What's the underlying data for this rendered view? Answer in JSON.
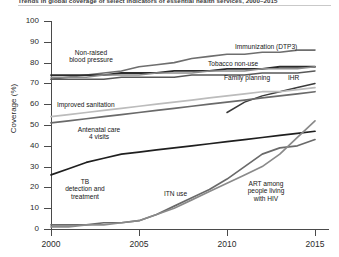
{
  "figure": {
    "title": "Trends in global coverage of select indicators of essential health services, 2000–2015",
    "y_axis_title": "Coverage (%)",
    "y_ticks": [
      "0",
      "10",
      "20",
      "30",
      "40",
      "50",
      "60",
      "70",
      "80",
      "90",
      "100"
    ],
    "x_ticks": [
      "2000",
      "2005",
      "2010",
      "2015"
    ]
  },
  "annotations": {
    "non_raised_bp": "Non-raised\nblood pressure",
    "non_raised_bp_l1": "Non-raised",
    "non_raised_bp_l2": "blood pressure",
    "immunization": "Immunization (DTP3)",
    "tobacco": "Tobacco non-use",
    "family_planning": "Family planning",
    "ihr": "IHR",
    "sanitation": "Improved sanitation",
    "anc_l1": "Antenatal care",
    "anc_l2": "4 visits",
    "tb_l1": "TB",
    "tb_l2": "detection and",
    "tb_l3": "treatment",
    "itn": "ITN use",
    "art_l1": "ART among",
    "art_l2": "people living",
    "art_l3": "with HIV"
  },
  "chart_data": {
    "type": "line",
    "title": "Trends in global coverage of select indicators of essential health services, 2000–2015",
    "xlabel": "",
    "ylabel": "Coverage (%)",
    "xlim": [
      2000,
      2015
    ],
    "ylim": [
      0,
      100
    ],
    "grid": false,
    "legend": "inline-labels",
    "x": [
      2000,
      2001,
      2002,
      2003,
      2004,
      2005,
      2006,
      2007,
      2008,
      2009,
      2010,
      2011,
      2012,
      2013,
      2014,
      2015
    ],
    "series": [
      {
        "name": "Immunization (DTP3)",
        "color": "#6e6e6e",
        "width": 1.6,
        "values": [
          72,
          73,
          74,
          75,
          76,
          78,
          79,
          80,
          82,
          83,
          84,
          84,
          85,
          85,
          86,
          86
        ]
      },
      {
        "name": "Non-raised blood pressure",
        "color": "#2b2b2b",
        "width": 1.8,
        "values": [
          74,
          74,
          74,
          74,
          75,
          75,
          75,
          76,
          76,
          76,
          77,
          77,
          77,
          78,
          78,
          78
        ]
      },
      {
        "name": "Tobacco non-use",
        "color": "#8c8c8c",
        "width": 1.5,
        "values": [
          73,
          73,
          73,
          74,
          74,
          74,
          75,
          75,
          75,
          76,
          76,
          76,
          77,
          77,
          77,
          78
        ]
      },
      {
        "name": "Family planning",
        "color": "#585858",
        "width": 1.5,
        "values": [
          72,
          72,
          72,
          72,
          73,
          73,
          73,
          73,
          74,
          74,
          74,
          74,
          75,
          75,
          75,
          76
        ]
      },
      {
        "name": "IHR",
        "color": "#3a3a3a",
        "width": 1.5,
        "values": [
          null,
          null,
          null,
          null,
          null,
          null,
          null,
          null,
          null,
          null,
          56,
          61,
          64,
          66,
          68,
          70
        ]
      },
      {
        "name": "Improved sanitation",
        "color": "#bcbcbc",
        "width": 1.7,
        "values": [
          54,
          55,
          56,
          57,
          58,
          59,
          60,
          61,
          62,
          63,
          64,
          65,
          66,
          66,
          67,
          68
        ]
      },
      {
        "name": "Antenatal care 4 visits",
        "color": "#6a6a6a",
        "width": 1.7,
        "values": [
          51,
          52,
          53,
          54,
          55,
          56,
          57,
          58,
          59,
          60,
          61,
          62,
          63,
          64,
          65,
          66
        ]
      },
      {
        "name": "TB detection and treatment",
        "color": "#1f1f1f",
        "width": 1.7,
        "values": [
          26,
          29,
          32,
          34,
          36,
          37,
          38,
          39,
          40,
          41,
          42,
          43,
          44,
          45,
          46,
          47
        ]
      },
      {
        "name": "ITN use",
        "color": "#6a6a6a",
        "width": 1.7,
        "values": [
          2,
          2,
          2,
          3,
          3,
          4,
          7,
          11,
          15,
          19,
          24,
          30,
          36,
          39,
          40,
          43
        ]
      },
      {
        "name": "ART among people living with HIV",
        "color": "#8a8a8a",
        "width": 1.7,
        "values": [
          1,
          1,
          2,
          2,
          3,
          4,
          7,
          10,
          14,
          18,
          22,
          26,
          30,
          36,
          44,
          52
        ]
      }
    ]
  },
  "geometry": {
    "x0": 51,
    "x1": 315,
    "y0": 229,
    "y100": 21,
    "x_tick_px": [
      51,
      139,
      227,
      315
    ]
  }
}
